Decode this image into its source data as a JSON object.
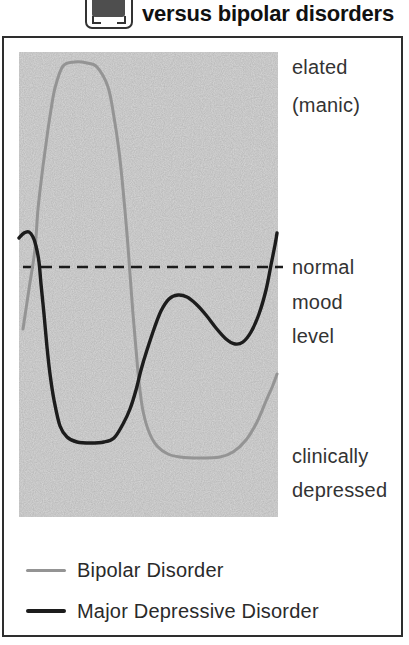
{
  "header": {
    "title": "versus bipolar disorders"
  },
  "axis_labels": {
    "elated": [
      "elated",
      "(manic)"
    ],
    "normal": [
      "normal",
      "mood",
      "level"
    ],
    "depressed": [
      "clinically",
      "depressed"
    ]
  },
  "legend": {
    "items": [
      {
        "label": "Bipolar Disorder",
        "color": "#949494"
      },
      {
        "label": "Major Depressive Disorder",
        "color": "#1c1c1c"
      }
    ]
  },
  "chart_data": {
    "type": "line",
    "title": "versus bipolar disorders",
    "xlabel": "",
    "ylabel": "",
    "grid": false,
    "legend_position": "bottom-left",
    "plot_bg": "#d9d9d9",
    "y_axis_labels": [
      "elated (manic)",
      "normal mood level",
      "clinically depressed"
    ],
    "baseline": {
      "label": "normal mood level",
      "style": "dashed",
      "y_px": 215,
      "x_px": [
        4,
        264
      ],
      "color": "#1b1b1b",
      "width": 2.4,
      "dash": [
        11,
        7
      ]
    },
    "series": [
      {
        "name": "Bipolar Disorder",
        "color": "#949494",
        "width": 3,
        "points": [
          [
            4,
            277
          ],
          [
            10,
            237
          ],
          [
            16,
            197
          ],
          [
            19,
            157
          ],
          [
            23,
            122
          ],
          [
            27,
            92
          ],
          [
            31,
            64
          ],
          [
            36,
            36
          ],
          [
            44,
            14
          ],
          [
            56,
            10
          ],
          [
            68,
            11
          ],
          [
            78,
            15
          ],
          [
            89,
            35
          ],
          [
            95,
            65
          ],
          [
            100,
            99
          ],
          [
            104,
            137
          ],
          [
            108,
            182
          ],
          [
            111,
            222
          ],
          [
            114,
            262
          ],
          [
            117,
            297
          ],
          [
            120,
            330
          ],
          [
            124,
            359
          ],
          [
            130,
            380
          ],
          [
            138,
            394
          ],
          [
            149,
            402
          ],
          [
            161,
            405
          ],
          [
            181,
            406
          ],
          [
            201,
            405
          ],
          [
            214,
            400
          ],
          [
            227,
            388
          ],
          [
            238,
            370
          ],
          [
            247,
            349
          ],
          [
            254,
            333
          ],
          [
            258,
            322
          ]
        ]
      },
      {
        "name": "Major Depressive Disorder",
        "color": "#1c1c1c",
        "width": 3.4,
        "points": [
          [
            0,
            186
          ],
          [
            5,
            181
          ],
          [
            10,
            180
          ],
          [
            14,
            185
          ],
          [
            17,
            194
          ],
          [
            20,
            210
          ],
          [
            22,
            232
          ],
          [
            25,
            262
          ],
          [
            28,
            295
          ],
          [
            31,
            322
          ],
          [
            35,
            348
          ],
          [
            41,
            374
          ],
          [
            48,
            385
          ],
          [
            58,
            390
          ],
          [
            72,
            391
          ],
          [
            85,
            390
          ],
          [
            95,
            386
          ],
          [
            104,
            372
          ],
          [
            111,
            357
          ],
          [
            117,
            338
          ],
          [
            122,
            318
          ],
          [
            128,
            298
          ],
          [
            135,
            277
          ],
          [
            142,
            259
          ],
          [
            150,
            247
          ],
          [
            159,
            243
          ],
          [
            168,
            245
          ],
          [
            177,
            252
          ],
          [
            187,
            263
          ],
          [
            197,
            276
          ],
          [
            207,
            287
          ],
          [
            216,
            292
          ],
          [
            224,
            290
          ],
          [
            232,
            280
          ],
          [
            240,
            262
          ],
          [
            247,
            238
          ],
          [
            252,
            213
          ],
          [
            256,
            193
          ],
          [
            258,
            181
          ]
        ]
      }
    ]
  }
}
